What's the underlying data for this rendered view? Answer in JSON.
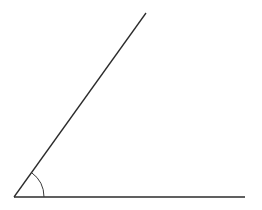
{
  "diagram": {
    "type": "angle",
    "background": "#ffffff",
    "stroke_color": "#2b2b2b",
    "arc_color": "#3a3a3a",
    "vertex": {
      "x": 14,
      "y": 197
    },
    "ray_end_slanted": {
      "x": 146,
      "y": 13
    },
    "ray_end_horizontal": {
      "x": 245,
      "y": 197
    },
    "arc_radius": 30,
    "labels": []
  }
}
